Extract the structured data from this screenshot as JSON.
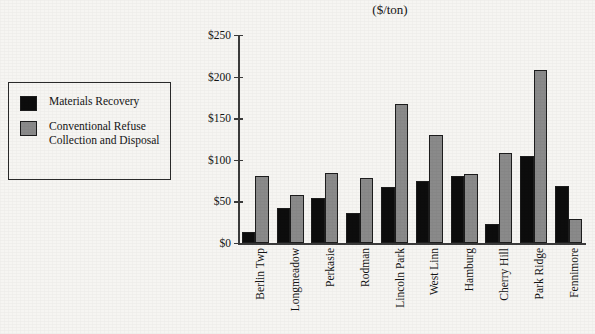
{
  "chart_data": {
    "type": "bar",
    "title": "",
    "subtitle": "($/ton)",
    "xlabel": "",
    "ylabel": "",
    "ylim": [
      0,
      250
    ],
    "ytick_labels": [
      "$0",
      "$50",
      "$100",
      "$150",
      "$200",
      "$250"
    ],
    "ytick_values": [
      0,
      50,
      100,
      150,
      200,
      250
    ],
    "grid": false,
    "legend_position": "left-outside",
    "categories": [
      "Berlin Twp",
      "Longmeadow",
      "Perkasie",
      "Rodman",
      "Lincoln Park",
      "West Linn",
      "Hamburg",
      "Cherry Hill",
      "Park Ridge",
      "Fennimore"
    ],
    "series": [
      {
        "name": "Materials Recovery",
        "color": "#0d0d0d",
        "values": [
          13,
          42,
          54,
          36,
          67,
          75,
          80,
          23,
          105,
          68
        ]
      },
      {
        "name": "Conventional Refuse Collection and Disposal",
        "color": "#8a8a8a",
        "values": [
          80,
          58,
          84,
          78,
          167,
          130,
          83,
          108,
          208,
          29
        ]
      }
    ]
  },
  "legend": {
    "items": [
      {
        "label": "Materials Recovery",
        "swatch": "black"
      },
      {
        "label": "Conventional Refuse Collection and Disposal",
        "swatch": "gray"
      }
    ]
  },
  "colors": {
    "background": "#f6f5f2",
    "axis": "#3b3b3b",
    "text": "#141414",
    "series_black": "#0d0d0d",
    "series_gray": "#8a8a8a",
    "bar_outline": "#1d1d1d"
  }
}
